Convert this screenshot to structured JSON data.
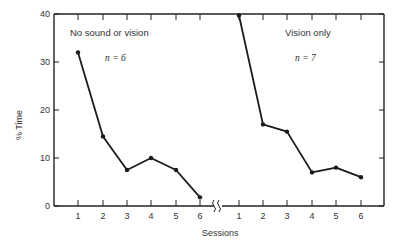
{
  "chart_data": {
    "type": "line",
    "title": "",
    "xlabel": "Sessions",
    "ylabel": "% Time",
    "ylim": [
      0,
      40
    ],
    "yticks": [
      0,
      10,
      20,
      30,
      40
    ],
    "grid": false,
    "legend": null,
    "panels": [
      {
        "label": "No sound or vision",
        "n_label": "n = 6",
        "categories": [
          "1",
          "2",
          "3",
          "4",
          "5",
          "6"
        ],
        "values": [
          32,
          14.5,
          7.5,
          10,
          7.5,
          1.8
        ]
      },
      {
        "label": "Vision only",
        "n_label": "n = 7",
        "categories": [
          "1",
          "2",
          "3",
          "4",
          "5",
          "6"
        ],
        "values": [
          39.7,
          17,
          15.5,
          7,
          8,
          6
        ]
      }
    ],
    "annotations": [
      "axis break between panels on x-axis"
    ]
  },
  "labels": {
    "xlabel": "Sessions",
    "ylabel": "% Time",
    "panel1": "No sound or vision",
    "panel1_n": "n = 6",
    "panel2": "Vision only",
    "panel2_n": "n = 7"
  }
}
